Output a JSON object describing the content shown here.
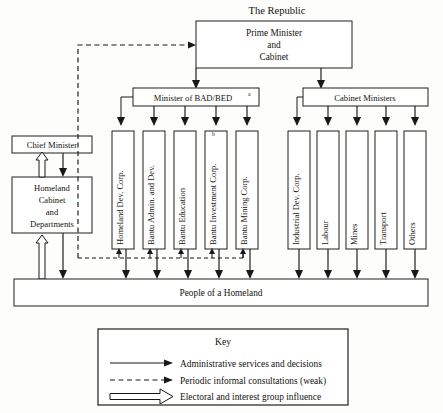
{
  "diagram": {
    "title": "The Republic",
    "type": "organizational-hierarchy-chart",
    "top_box": {
      "lines": [
        "Prime Minister",
        "and",
        "Cabinet"
      ]
    },
    "ministries": [
      {
        "id": "bad-bed",
        "label": "Minister of BAD/BED",
        "superscript": "a"
      },
      {
        "id": "cabinet-ministers",
        "label": "Cabinet Ministers",
        "superscript": ""
      }
    ],
    "left_column": {
      "chief_minister": "Chief Minister",
      "homeland_cabinet": [
        "Homeland",
        "Cabinet",
        "and",
        "Departments"
      ]
    },
    "bad_bed_agencies": [
      {
        "id": "homeland-dev-corp",
        "label": "Homeland Dev. Corp.",
        "superscript": ""
      },
      {
        "id": "bantu-admin-and-dev",
        "label": "Bantu Admin. and Dev.",
        "superscript": ""
      },
      {
        "id": "bantu-education",
        "label": "Bantu Education",
        "superscript": ""
      },
      {
        "id": "bantu-investment-corp",
        "label": "Bantu Investment Corp.",
        "superscript": "b"
      },
      {
        "id": "bantu-mining-corp",
        "label": "Bantu Mining Corp.",
        "superscript": ""
      }
    ],
    "cabinet_agencies": [
      {
        "id": "industrial-dev-corp",
        "label": "Industrial Dev. Corp.",
        "superscript": ""
      },
      {
        "id": "labour",
        "label": "Labour",
        "superscript": ""
      },
      {
        "id": "mines",
        "label": "Mines",
        "superscript": ""
      },
      {
        "id": "transport",
        "label": "Transport",
        "superscript": ""
      },
      {
        "id": "others",
        "label": "Others",
        "superscript": ""
      }
    ],
    "base_bar": "People of a Homeland",
    "key": {
      "title": "Key",
      "entries": [
        {
          "id": "administrative",
          "style": "solid-arrow",
          "label": "Administrative services and decisions"
        },
        {
          "id": "consultations",
          "style": "dashed-arrow",
          "label": "Periodic informal consultations (weak)"
        },
        {
          "id": "electoral",
          "style": "hollow-arrow",
          "label": "Electoral and interest group influence"
        }
      ]
    },
    "colors": {
      "ink": "#181818",
      "paper": "#fdfdfb",
      "box_fill": "#ffffff"
    }
  }
}
